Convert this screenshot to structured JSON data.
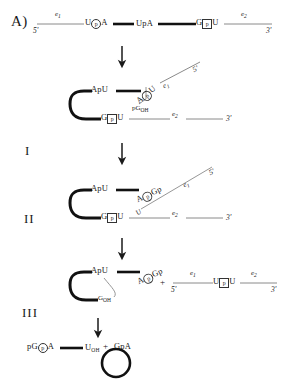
{
  "figure": {
    "panel_label": "A)",
    "steps": [
      "I",
      "II",
      "III"
    ]
  },
  "symbols": {
    "five_prime": "5'",
    "three_prime": "3'",
    "exon1": "e",
    "exon1_sub": "1",
    "exon2": "e",
    "exon2_sub": "2",
    "plus": "+",
    "phosphate": "p",
    "hydroxyl": "OH"
  },
  "row_precursor": {
    "name": "precursor-rna",
    "five_prime": "5'",
    "exon1_label": "e",
    "exon1_sub": "1",
    "branch_left": "U",
    "branch_p": "p",
    "branch_right": "A",
    "intron_mid": "UpA",
    "splice3_left": "G",
    "splice3_p": "p",
    "splice3_right": "U",
    "exon2_label": "e",
    "exon2_sub": "2",
    "three_prime": "3'"
  },
  "step1_lariat": {
    "name": "lariat-intermediate-I",
    "apu": "ApU",
    "branch_left": "A",
    "branch_p": "p",
    "branch_right": "U",
    "pg_oh": "pG",
    "pg_oh_sub": "OH",
    "splice3_left": "G",
    "splice3_p": "p",
    "splice3_right": "U",
    "exon2_label": "e",
    "exon2_sub": "2",
    "three_prime": "3'",
    "free_exon1": "e",
    "free_exon1_sub": "1",
    "free_five_prime": "5'"
  },
  "step2_lariat": {
    "name": "lariat-intermediate-II",
    "apu": "ApU",
    "branch_left": "A",
    "branch_p": "p",
    "branch_right": "Gp",
    "inner_u": "U",
    "splice3_left": "G",
    "splice3_p": "p",
    "splice3_right": "U",
    "exon2_label": "e",
    "exon2_sub": "2",
    "three_prime": "3'",
    "free_exon1": "e",
    "free_exon1_sub": "1",
    "free_five_prime": "5'"
  },
  "step3_products": {
    "name": "products-III",
    "apu": "ApU",
    "branch_left": "A",
    "branch_p": "p",
    "branch_right": "Gp",
    "g_oh": "G",
    "g_oh_sub": "OH",
    "plus": "+",
    "ligated_five_prime": "5'",
    "ligated_exon1": "e",
    "ligated_exon1_sub": "1",
    "junction_left": "U",
    "junction_p": "p",
    "junction_right": "U",
    "ligated_exon2": "e",
    "ligated_exon2_sub": "2",
    "ligated_three_prime": "3'"
  },
  "step4_products": {
    "name": "final-products",
    "pg_left": "pG",
    "pg_p": "p",
    "pg_right": "A",
    "u_oh": "U",
    "u_oh_sub": "OH",
    "plus": "+",
    "circle_label": "GpA"
  },
  "colors": {
    "ink": "#1a1a1a",
    "thin_line": "#8a8a8a",
    "thick_line": "#111111",
    "background": "#ffffff"
  }
}
